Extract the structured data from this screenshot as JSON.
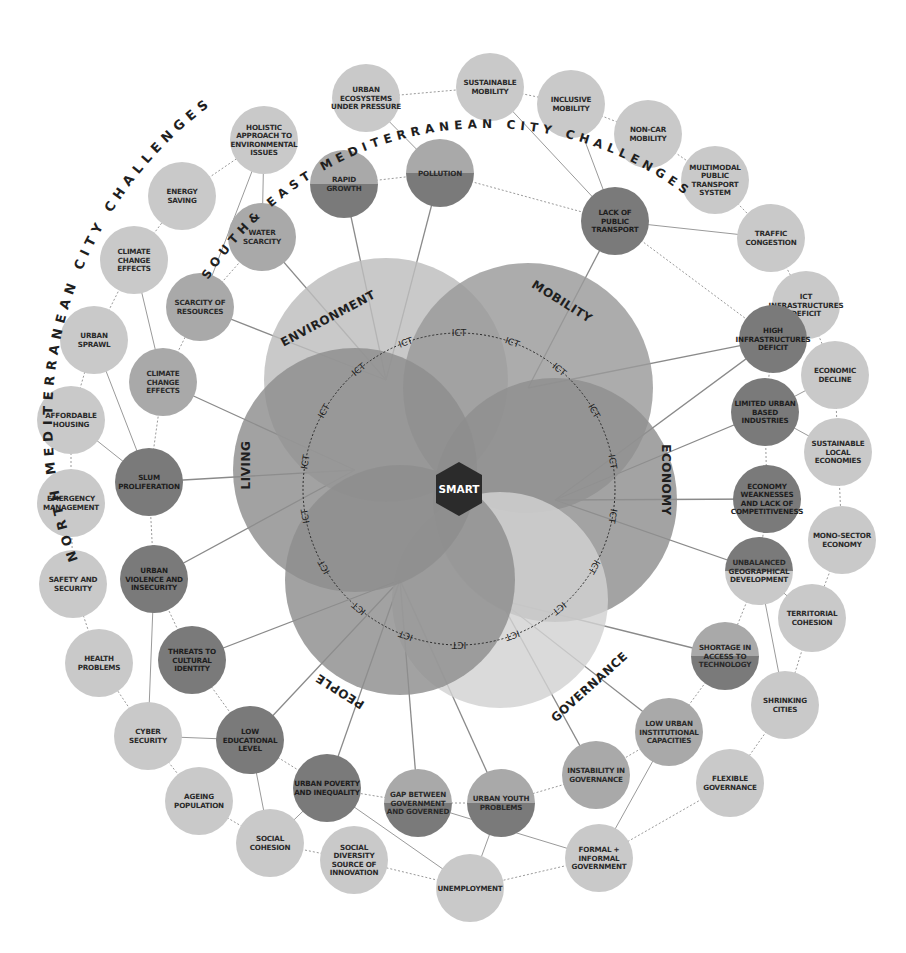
{
  "titles": {
    "outer_arc": "NORTH MEDITERRANEAN CITY CHALLENGES",
    "inner_arc": "SOUTH& EAST MEDITERRANEAN CITY CHALLENGES"
  },
  "center": {
    "label": "SMART",
    "color": "#2b2b2b"
  },
  "ict_ring": {
    "label": "ICT",
    "count": 18
  },
  "colors": {
    "light_node": "#c9c9c9",
    "mid_node": "#a9a9a9",
    "dark_node": "#7a7a7a",
    "line": "#8a8a8a",
    "background": "#ffffff"
  },
  "domains": [
    {
      "id": "environment",
      "label": "ENVIRONMENT",
      "color": "#bdbdbd"
    },
    {
      "id": "mobility",
      "label": "MOBILITY",
      "color": "#9a9a9a"
    },
    {
      "id": "economy",
      "label": "ECONOMY",
      "color": "#8f8f8f"
    },
    {
      "id": "governance",
      "label": "GOVERNANCE",
      "color": "#d2d2d2"
    },
    {
      "id": "people",
      "label": "PEOPLE",
      "color": "#8d8d8d"
    },
    {
      "id": "living",
      "label": "LIVING",
      "color": "#8e8e8e"
    }
  ],
  "north_challenges": [
    {
      "id": "n1",
      "lines": [
        "URBAN",
        "ECOSYSTEMS",
        "UNDER PRESSURE"
      ]
    },
    {
      "id": "n2",
      "lines": [
        "SUSTAINABLE",
        "MOBILITY"
      ]
    },
    {
      "id": "n3",
      "lines": [
        "INCLUSIVE",
        "MOBILITY"
      ]
    },
    {
      "id": "n4",
      "lines": [
        "NON-CAR",
        "MOBILITY"
      ]
    },
    {
      "id": "n5",
      "lines": [
        "MULTIMODAL",
        "PUBLIC",
        "TRANSPORT",
        "SYSTEM"
      ]
    },
    {
      "id": "n6",
      "lines": [
        "TRAFFIC",
        "CONGESTION"
      ]
    },
    {
      "id": "n7",
      "lines": [
        "ICT",
        "INFRASTRUCTURES",
        "DEFICIT"
      ]
    },
    {
      "id": "n8",
      "lines": [
        "ECONOMIC",
        "DECLINE"
      ]
    },
    {
      "id": "n9",
      "lines": [
        "SUSTAINABLE",
        "LOCAL",
        "ECONOMIES"
      ]
    },
    {
      "id": "n10",
      "lines": [
        "MONO-SECTOR",
        "ECONOMY"
      ]
    },
    {
      "id": "n11",
      "lines": [
        "TERRITORIAL",
        "COHESION"
      ]
    },
    {
      "id": "n12",
      "lines": [
        "SHRINKING",
        "CITIES"
      ]
    },
    {
      "id": "n13",
      "lines": [
        "FLEXIBLE",
        "GOVERNANCE"
      ]
    },
    {
      "id": "n14",
      "lines": [
        "FORMAL +",
        "INFORMAL",
        "GOVERNMENT"
      ]
    },
    {
      "id": "n15",
      "lines": [
        "UNEMPLOYMENT"
      ]
    },
    {
      "id": "n16",
      "lines": [
        "SOCIAL",
        "DIVERSITY",
        "SOURCE OF",
        "INNOVATION"
      ]
    },
    {
      "id": "n17",
      "lines": [
        "SOCIAL",
        "COHESION"
      ]
    },
    {
      "id": "n18",
      "lines": [
        "AGEING",
        "POPULATION"
      ]
    },
    {
      "id": "n19",
      "lines": [
        "CYBER",
        "SECURITY"
      ]
    },
    {
      "id": "n20",
      "lines": [
        "HEALTH",
        "PROBLEMS"
      ]
    },
    {
      "id": "n21",
      "lines": [
        "SAFETY AND",
        "SECURITY"
      ]
    },
    {
      "id": "n22",
      "lines": [
        "EMERGENCY",
        "MANAGEMENT"
      ]
    },
    {
      "id": "n23",
      "lines": [
        "AFFORDABLE",
        "HOUSING"
      ]
    },
    {
      "id": "n24",
      "lines": [
        "URBAN",
        "SPRAWL"
      ]
    },
    {
      "id": "n25",
      "lines": [
        "CLIMATE",
        "CHANGE",
        "EFFECTS"
      ]
    },
    {
      "id": "n26",
      "lines": [
        "ENERGY",
        "SAVING"
      ]
    },
    {
      "id": "n27",
      "lines": [
        "HOLISTIC",
        "APPROACH TO",
        "ENVIRONMENTAL",
        "ISSUES"
      ]
    }
  ],
  "south_east_challenges": [
    {
      "id": "s1",
      "lines": [
        "RAPID",
        "GROWTH"
      ],
      "style": "half-bottom"
    },
    {
      "id": "s2",
      "lines": [
        "POLLUTION"
      ],
      "style": "half-bottom"
    },
    {
      "id": "s3",
      "lines": [
        "LACK OF",
        "PUBLIC",
        "TRANSPORT"
      ],
      "style": "dark"
    },
    {
      "id": "s4",
      "lines": [
        "HIGH",
        "INFRASTRUCTURES",
        "DEFICIT"
      ],
      "style": "dark"
    },
    {
      "id": "s5",
      "lines": [
        "LIMITED URBAN",
        "BASED",
        "INDUSTRIES"
      ],
      "style": "dark"
    },
    {
      "id": "s6",
      "lines": [
        "ECONOMY",
        "WEAKNESSES",
        "AND LACK OF",
        "COMPETITIVENESS"
      ],
      "style": "dark"
    },
    {
      "id": "s7",
      "lines": [
        "UNBALANCED",
        "GEOGRAPHICAL",
        "DEVELOPMENT"
      ],
      "style": "half-top"
    },
    {
      "id": "s8",
      "lines": [
        "SHORTAGE IN",
        "ACCESS TO",
        "TECHNOLOGY"
      ],
      "style": "half-bottom"
    },
    {
      "id": "s9",
      "lines": [
        "LOW URBAN",
        "INSTITUTIONAL",
        "CAPACITIES"
      ],
      "style": "mid"
    },
    {
      "id": "s10",
      "lines": [
        "INSTABILITY IN",
        "GOVERNANCE"
      ],
      "style": "mid"
    },
    {
      "id": "s11",
      "lines": [
        "URBAN YOUTH",
        "PROBLEMS"
      ],
      "style": "half-bottom"
    },
    {
      "id": "s12",
      "lines": [
        "GAP BETWEEN",
        "GOVERNMENT",
        "AND GOVERNED"
      ],
      "style": "half-bottom"
    },
    {
      "id": "s13",
      "lines": [
        "URBAN POVERTY",
        "AND INEQUALITY"
      ],
      "style": "dark"
    },
    {
      "id": "s14",
      "lines": [
        "LOW",
        "EDUCATIONAL",
        "LEVEL"
      ],
      "style": "dark"
    },
    {
      "id": "s15",
      "lines": [
        "THREATS TO",
        "CULTURAL",
        "IDENTITY"
      ],
      "style": "dark"
    },
    {
      "id": "s16",
      "lines": [
        "URBAN",
        "VIOLENCE AND",
        "INSECURITY"
      ],
      "style": "dark"
    },
    {
      "id": "s17",
      "lines": [
        "SLUM",
        "PROLIFERATION"
      ],
      "style": "dark"
    },
    {
      "id": "s18",
      "lines": [
        "CLIMATE",
        "CHANGE",
        "EFFECTS"
      ],
      "style": "mid"
    },
    {
      "id": "s19",
      "lines": [
        "SCARCITY OF",
        "RESOURCES"
      ],
      "style": "mid"
    },
    {
      "id": "s20",
      "lines": [
        "WATER",
        "SCARCITY"
      ],
      "style": "mid"
    }
  ]
}
